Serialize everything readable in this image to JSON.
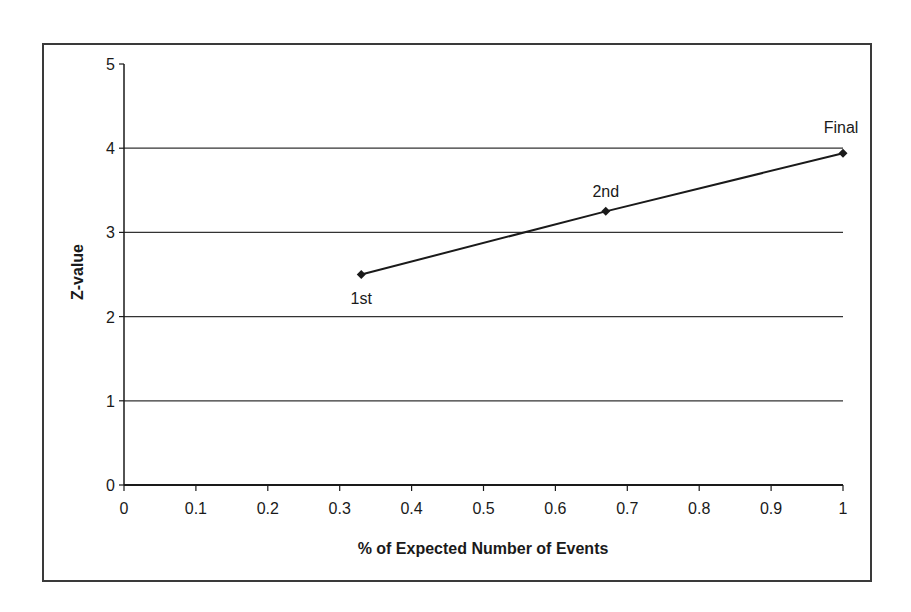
{
  "chart_data": {
    "type": "line",
    "title": "",
    "xlabel": "% of Expected Number of Events",
    "ylabel": "Z-value",
    "xlim": [
      0,
      1
    ],
    "ylim": [
      0,
      5
    ],
    "x_ticks": [
      "0",
      "0.1",
      "0.2",
      "0.3",
      "0.4",
      "0.5",
      "0.6",
      "0.7",
      "0.8",
      "0.9",
      "1"
    ],
    "y_ticks": [
      "0",
      "1",
      "2",
      "3",
      "4",
      "5"
    ],
    "grid": {
      "horizontal": true,
      "vertical": false
    },
    "legend": null,
    "series": [
      {
        "name": "Z-value",
        "marker": "diamond",
        "color": "#1a1a1a",
        "x": [
          0.33,
          0.67,
          1.0
        ],
        "values": [
          2.5,
          3.25,
          3.94
        ],
        "point_labels": [
          "1st",
          "2nd",
          "Final"
        ]
      }
    ]
  },
  "colors": {
    "line": "#1a1a1a",
    "grid": "#333333",
    "frame": "#3a3a3a",
    "background": "#ffffff"
  }
}
